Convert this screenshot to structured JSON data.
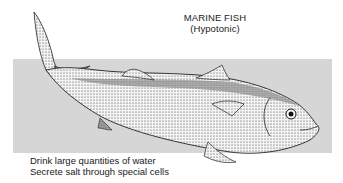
{
  "diagram": {
    "title": "MARINE FISH",
    "subtitle": "(Hypotonic)",
    "captions": [
      "Drink large quantities of water",
      "Secrete salt through special cells"
    ],
    "background_band_color": "#d6d6d6",
    "illustration": "marine-fish-drawing"
  }
}
